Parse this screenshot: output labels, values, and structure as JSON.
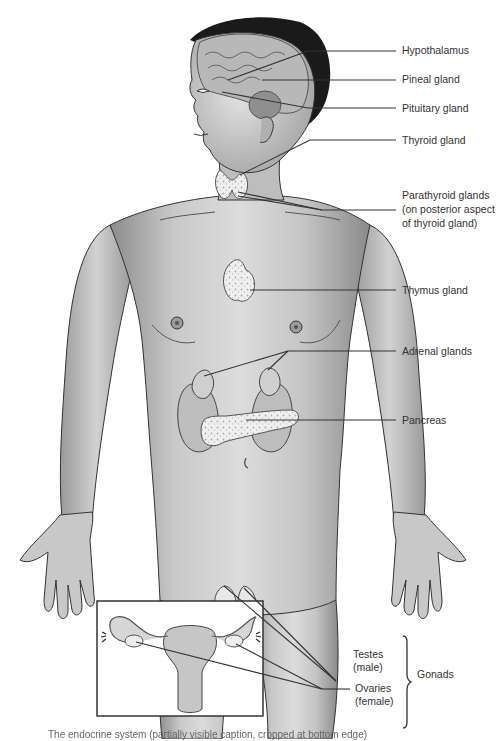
{
  "figure": {
    "colors": {
      "background": "#ffffff",
      "skin_light": "#d9d9d9",
      "skin_mid": "#b5b5b5",
      "skin_dark": "#8a8a8a",
      "hair": "#1a1a1a",
      "outline": "#333333",
      "leader_line": "#333333",
      "gland_fill": "#eeeeee"
    }
  },
  "labels": {
    "hypothalamus": "Hypothalamus",
    "pineal": "Pineal gland",
    "pituitary": "Pituitary gland",
    "thyroid": "Thyroid gland",
    "parathyroid_line1": "Parathyroid glands",
    "parathyroid_line2": "(on posterior aspect",
    "parathyroid_line3": "of thyroid gland)",
    "thymus": "Thymus gland",
    "adrenal": "Adrenal glands",
    "pancreas": "Pancreas",
    "testes_line1": "Testes",
    "testes_line2": "(male)",
    "ovaries_line1": "Ovaries",
    "ovaries_line2": "(female)",
    "gonads": "Gonads"
  },
  "inset": {
    "name": "female reproductive organs inset"
  },
  "caption": {
    "text": "The endocrine system (partially visible caption, cropped at bottom edge)"
  }
}
